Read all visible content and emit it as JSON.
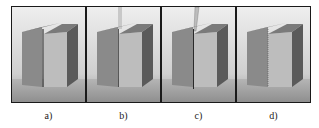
{
  "figure": {
    "panels": [
      {
        "id": "a",
        "label": "a)",
        "tool": "none",
        "gap": "open"
      },
      {
        "id": "b",
        "label": "b)",
        "tool": "rod-above",
        "gap": "narrow"
      },
      {
        "id": "c",
        "label": "c)",
        "tool": "rod-in-gap",
        "gap": "narrow"
      },
      {
        "id": "d",
        "label": "d)",
        "tool": "none",
        "gap": "joined"
      }
    ],
    "colors": {
      "frame": "#1a1a1a",
      "background_top": "#e8e8e8",
      "background_bottom": "#9a9a9a",
      "left_block_front": "#8a8a8a",
      "right_block_front": "#b8b8b8",
      "block_top": "#6e6e6e",
      "block_side": "#555555",
      "floor": "#a8a8a8"
    }
  }
}
